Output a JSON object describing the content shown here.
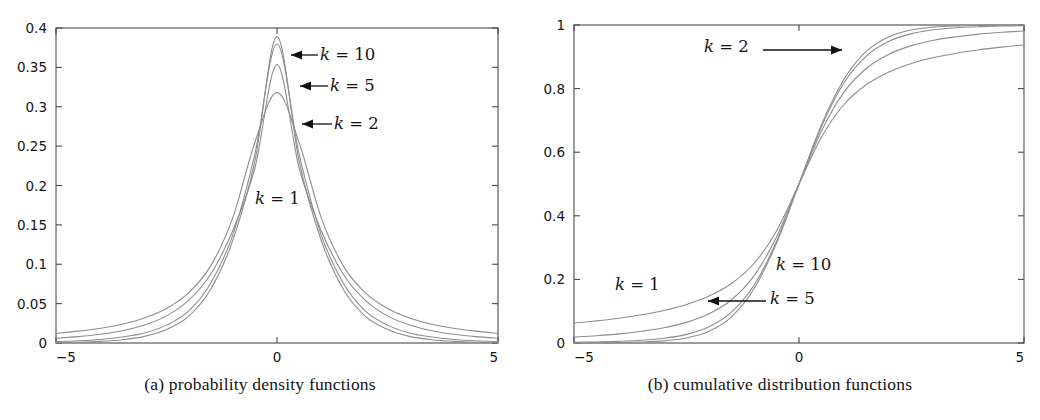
{
  "figure": {
    "panels": [
      {
        "id": "a",
        "caption": "(a) probability density functions",
        "box": {
          "x": 56,
          "y": 28,
          "w": 442,
          "h": 315
        },
        "x_axis": {
          "label": "",
          "min": -5,
          "max": 5,
          "ticks": [
            -5,
            0,
            5
          ],
          "tick_labels": [
            "−5",
            "0",
            "5"
          ]
        },
        "y_axis": {
          "label": "",
          "min": 0,
          "max": 0.4,
          "ticks": [
            0,
            0.05,
            0.1,
            0.15,
            0.2,
            0.25,
            0.3,
            0.35,
            0.4
          ],
          "tick_labels": [
            "0",
            "0.05",
            "0.1",
            "0.15",
            "0.2",
            "0.25",
            "0.3",
            "0.35",
            "0.4"
          ]
        },
        "annotations": [
          {
            "name": "k-10",
            "k_label": "k",
            "eq": "= 10",
            "text": "k = 10",
            "x": 320,
            "y": 48,
            "arrow": "left",
            "arrow_from_x": 318,
            "arrow_to_x": 291,
            "arrow_y": 55
          },
          {
            "name": "k-5",
            "k_label": "k",
            "eq": "= 5",
            "text": "k = 5",
            "x": 330,
            "y": 79,
            "arrow": "left",
            "arrow_from_x": 328,
            "arrow_to_x": 300,
            "arrow_y": 86
          },
          {
            "name": "k-2",
            "k_label": "k",
            "eq": "= 2",
            "text": "k = 2",
            "x": 334,
            "y": 117,
            "arrow": "left",
            "arrow_from_x": 332,
            "arrow_to_x": 302,
            "arrow_y": 124
          },
          {
            "name": "k-1",
            "k_label": "k",
            "eq": "= 1",
            "text": "k = 1",
            "x": 255,
            "y": 192,
            "arrow": "none"
          }
        ]
      },
      {
        "id": "b",
        "caption": "(b) cumulative distribution functions",
        "box": {
          "x": 54,
          "y": 25,
          "w": 450,
          "h": 318
        },
        "x_axis": {
          "label": "",
          "min": -5,
          "max": 5,
          "ticks": [
            -5,
            0,
            5
          ],
          "tick_labels": [
            "−5",
            "0",
            "5"
          ]
        },
        "y_axis": {
          "label": "",
          "min": 0,
          "max": 1,
          "ticks": [
            0,
            0.2,
            0.4,
            0.6,
            0.8,
            1
          ],
          "tick_labels": [
            "0",
            "0.2",
            "0.4",
            "0.6",
            "0.8",
            "1"
          ]
        },
        "annotations": [
          {
            "name": "k-2",
            "k_label": "k",
            "eq": "= 2",
            "text": "k = 2",
            "x": 184,
            "y": 40,
            "arrow": "right",
            "arrow_from_x": 243,
            "arrow_to_x": 322,
            "arrow_y": 50
          },
          {
            "name": "k-10",
            "k_label": "k",
            "eq": "= 10",
            "text": "k = 10",
            "x": 256,
            "y": 258,
            "arrow": "none"
          },
          {
            "name": "k-1",
            "k_label": "k",
            "eq": "= 1",
            "text": "k = 1",
            "x": 95,
            "y": 278,
            "arrow": "none"
          },
          {
            "name": "k-5",
            "k_label": "k",
            "eq": "= 5",
            "text": "k = 5",
            "x": 250,
            "y": 292,
            "arrow": "left",
            "arrow_from_x": 246,
            "arrow_to_x": 188,
            "arrow_y": 301
          }
        ]
      }
    ]
  },
  "style": {
    "curve_color": "#8d8d8d",
    "axis_color": "#4a4a4a",
    "text_color": "#141414",
    "background": "#ffffff",
    "curve_width": 1.1
  },
  "chart_data": [
    {
      "type": "line",
      "title": "(a) probability density functions",
      "xlabel": "",
      "ylabel": "",
      "xlim": [
        -5,
        5
      ],
      "ylim": [
        0,
        0.4
      ],
      "xticks": [
        -5,
        0,
        5
      ],
      "yticks": [
        0,
        0.05,
        0.1,
        0.15,
        0.2,
        0.25,
        0.3,
        0.35,
        0.4
      ],
      "grid": false,
      "legend": "inline-annotations",
      "distribution": "Student-t probability density function",
      "x": [
        -5,
        -4.5,
        -4,
        -3.5,
        -3,
        -2.5,
        -2,
        -1.5,
        -1,
        -0.5,
        0,
        0.5,
        1,
        1.5,
        2,
        2.5,
        3,
        3.5,
        4,
        4.5,
        5
      ],
      "series": [
        {
          "name": "k = 1",
          "k": 1,
          "values": [
            0.01224,
            0.01504,
            0.01872,
            0.02372,
            0.03183,
            0.04387,
            0.06366,
            0.09794,
            0.15915,
            0.25465,
            0.31831,
            0.25465,
            0.15915,
            0.09794,
            0.06366,
            0.04387,
            0.03183,
            0.02372,
            0.01872,
            0.01504,
            0.01224
          ]
        },
        {
          "name": "k = 2",
          "k": 2,
          "values": [
            0.00609,
            0.00812,
            0.0111,
            0.01563,
            0.02276,
            0.03444,
            0.05413,
            0.0874,
            0.14288,
            0.22222,
            0.35355,
            0.22222,
            0.14288,
            0.0874,
            0.05413,
            0.03444,
            0.02276,
            0.01563,
            0.0111,
            0.00812,
            0.00609
          ]
        },
        {
          "name": "k = 5",
          "k": 5,
          "values": [
            0.00173,
            0.00277,
            0.00452,
            0.00755,
            0.0127,
            0.02271,
            0.04051,
            0.07593,
            0.1373,
            0.24001,
            0.37961,
            0.24001,
            0.1373,
            0.07593,
            0.04051,
            0.02271,
            0.0127,
            0.00755,
            0.00452,
            0.00277,
            0.00173
          ]
        },
        {
          "name": "k = 10",
          "k": 10,
          "values": [
            0.00053,
            0.00103,
            0.00205,
            0.0041,
            0.00846,
            0.01714,
            0.03376,
            0.06818,
            0.13044,
            0.23091,
            0.3891,
            0.23091,
            0.13044,
            0.06818,
            0.03376,
            0.01714,
            0.00846,
            0.0041,
            0.00205,
            0.00103,
            0.00053
          ]
        }
      ],
      "peaks": {
        "k = 1": 0.3183,
        "k = 2": 0.3536,
        "k = 5": 0.3796,
        "k = 10": 0.3891
      }
    },
    {
      "type": "line",
      "title": "(b) cumulative distribution functions",
      "xlabel": "",
      "ylabel": "",
      "xlim": [
        -5,
        5
      ],
      "ylim": [
        0,
        1
      ],
      "xticks": [
        -5,
        0,
        5
      ],
      "yticks": [
        0,
        0.2,
        0.4,
        0.6,
        0.8,
        1
      ],
      "grid": false,
      "legend": "inline-annotations",
      "distribution": "Student-t cumulative distribution function",
      "x": [
        -5,
        -4.5,
        -4,
        -3.5,
        -3,
        -2.5,
        -2,
        -1.5,
        -1,
        -0.5,
        0,
        0.5,
        1,
        1.5,
        2,
        2.5,
        3,
        3.5,
        4,
        4.5,
        5
      ],
      "series": [
        {
          "name": "k = 1",
          "k": 1,
          "values": [
            0.0628,
            0.0697,
            0.078,
            0.0886,
            0.1024,
            0.1211,
            0.1476,
            0.1872,
            0.25,
            0.3524,
            0.5,
            0.6476,
            0.75,
            0.8128,
            0.8524,
            0.8789,
            0.8976,
            0.9114,
            0.922,
            0.9303,
            0.9372
          ]
        },
        {
          "name": "k = 2",
          "k": 2,
          "values": [
            0.0189,
            0.0229,
            0.0286,
            0.0368,
            0.0477,
            0.0648,
            0.0918,
            0.1361,
            0.2113,
            0.3333,
            0.5,
            0.6667,
            0.7887,
            0.8639,
            0.9082,
            0.9352,
            0.9523,
            0.9632,
            0.9714,
            0.9771,
            0.9811
          ]
        },
        {
          "name": "k = 5",
          "k": 5,
          "values": [
            0.0021,
            0.0032,
            0.0052,
            0.0086,
            0.015,
            0.0272,
            0.051,
            0.097,
            0.1816,
            0.3191,
            0.5,
            0.6809,
            0.8184,
            0.903,
            0.949,
            0.9728,
            0.985,
            0.9914,
            0.9948,
            0.9968,
            0.9979
          ]
        },
        {
          "name": "k = 10",
          "k": 10,
          "values": [
            0.0003,
            0.0006,
            0.0013,
            0.0029,
            0.0067,
            0.0157,
            0.0367,
            0.0822,
            0.1704,
            0.3139,
            0.5,
            0.6861,
            0.8296,
            0.9178,
            0.9633,
            0.9843,
            0.9933,
            0.9971,
            0.9987,
            0.9994,
            0.9997
          ]
        }
      ],
      "endpoints_at_x_5": {
        "k = 1": 0.937,
        "k = 2": 0.981,
        "k = 5": 0.998,
        "k = 10": 1.0
      }
    }
  ]
}
